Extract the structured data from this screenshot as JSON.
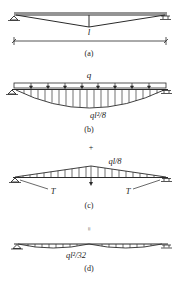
{
  "figure": {
    "panels": [
      {
        "id": "a",
        "caption": "(a)",
        "span_label": "l"
      },
      {
        "id": "b",
        "caption": "(b)",
        "load_label": "q",
        "moment_label": "ql²/8"
      },
      {
        "id": "c",
        "caption": "(c)",
        "force_label": "ql/8",
        "tension_left": "T",
        "tension_right": "T"
      },
      {
        "id": "d",
        "caption": "(d)",
        "moment_label": "ql²/32"
      }
    ],
    "operators": {
      "plus": "+",
      "equals": "="
    }
  },
  "colors": {
    "line": "#2a2a2a",
    "text": "#222222",
    "background": "#ffffff"
  }
}
